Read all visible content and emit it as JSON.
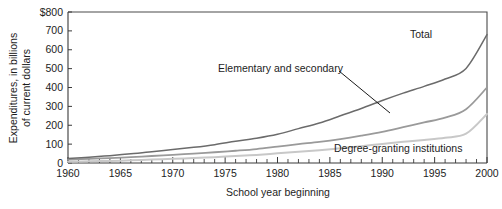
{
  "chart_data": {
    "type": "line",
    "title": "",
    "xlabel": "School year beginning",
    "ylabel_line1": "Expenditures, in billions",
    "ylabel_line2": "of current dollars",
    "xlim": [
      1960,
      2000
    ],
    "ylim": [
      0,
      800
    ],
    "ytick_labels": [
      "0",
      "100",
      "200",
      "300",
      "400",
      "500",
      "600",
      "700",
      "$800"
    ],
    "ytick_values": [
      0,
      100,
      200,
      300,
      400,
      500,
      600,
      700,
      800
    ],
    "xtick_labels": [
      "1960",
      "1965",
      "1970",
      "1975",
      "1980",
      "1985",
      "1990",
      "1995",
      "2000"
    ],
    "xtick_values": [
      1960,
      1965,
      1970,
      1975,
      1980,
      1985,
      1990,
      1995,
      2000
    ],
    "xtick_minor_step": 1,
    "grid": false,
    "legend_position": "inline-annotations",
    "x": [
      1960,
      1962,
      1964,
      1966,
      1968,
      1970,
      1972,
      1974,
      1976,
      1978,
      1980,
      1982,
      1984,
      1986,
      1988,
      1990,
      1992,
      1994,
      1996,
      1998,
      2000
    ],
    "series": [
      {
        "name": "Total",
        "color": "#6b6b6b",
        "values": [
          24,
          31,
          39,
          49,
          59,
          71,
          83,
          97,
          115,
          131,
          152,
          182,
          212,
          250,
          289,
          331,
          370,
          406,
          445,
          501,
          680
        ]
      },
      {
        "name": "Elementary and secondary",
        "color": "#9a9a9a",
        "values": [
          18,
          22,
          26,
          31,
          37,
          43,
          50,
          57,
          65,
          74,
          87,
          100,
          112,
          127,
          145,
          165,
          190,
          215,
          240,
          285,
          400
        ]
      },
      {
        "name": "Degree-granting institutions",
        "color": "#c8c8c8",
        "values": [
          7,
          9,
          11,
          14,
          18,
          22,
          26,
          31,
          37,
          43,
          51,
          60,
          68,
          78,
          89,
          101,
          112,
          122,
          134,
          155,
          260
        ]
      }
    ],
    "annotations": [
      {
        "text": "Total",
        "x_px": 410,
        "y_px": 38,
        "anchor": "start",
        "leader": false
      },
      {
        "text": "Elementary and secondary",
        "x_px": 218,
        "y_px": 72,
        "anchor": "start",
        "leader": true,
        "leader_from_x": 339,
        "leader_from_y": 71,
        "leader_to_x": 390,
        "leader_to_y": 113
      },
      {
        "text": "Degree-granting institutions",
        "x_px": 334,
        "y_px": 152,
        "anchor": "start",
        "leader": false
      }
    ]
  },
  "plot_geometry": {
    "left_px": 68,
    "right_px": 487,
    "top_px": 12,
    "bottom_px": 163
  }
}
